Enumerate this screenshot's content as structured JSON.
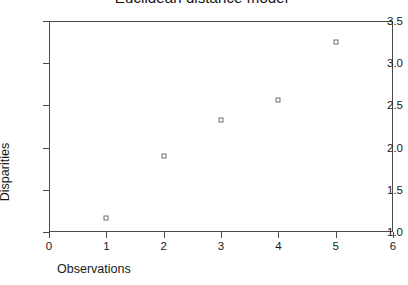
{
  "chart_data": {
    "type": "scatter",
    "title": "Euclidean distance model",
    "xlabel": "Observations",
    "ylabel": "Disparities",
    "x": [
      1,
      2,
      3,
      4,
      5
    ],
    "values": [
      1.17,
      1.9,
      2.33,
      2.56,
      3.25
    ],
    "series": [
      {
        "name": "Disparities",
        "points": [
          {
            "x": 1,
            "y": 1.17
          },
          {
            "x": 2,
            "y": 1.9
          },
          {
            "x": 3,
            "y": 2.33
          },
          {
            "x": 4,
            "y": 2.56
          },
          {
            "x": 5,
            "y": 3.25
          }
        ]
      }
    ],
    "xlim": [
      0,
      6
    ],
    "ylim": [
      1.0,
      3.5
    ],
    "xticks": [
      "0",
      "1",
      "2",
      "3",
      "4",
      "5",
      "6"
    ],
    "xtick_values": [
      0,
      1,
      2,
      3,
      4,
      5,
      6
    ],
    "yticks": [
      "1.0",
      "1.5",
      "2.0",
      "2.5",
      "3.0",
      "3.5"
    ],
    "ytick_values": [
      1.0,
      1.5,
      2.0,
      2.5,
      3.0,
      3.5
    ],
    "grid": false,
    "legend": false,
    "marker": "open-square",
    "marker_color": "#6e6e6e",
    "axis_color": "#4a4a4a",
    "background": "#ffffff"
  }
}
